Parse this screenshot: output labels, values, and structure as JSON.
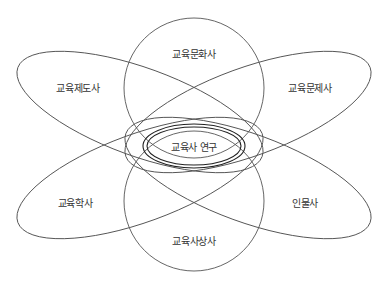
{
  "diagram": {
    "center_label": "교육사 연구",
    "areas": [
      {
        "id": "culture",
        "label": "교육문화사",
        "position": "top"
      },
      {
        "id": "institution",
        "label": "교육제도사",
        "position": "upper-left"
      },
      {
        "id": "problem",
        "label": "교육문제사",
        "position": "upper-right"
      },
      {
        "id": "discipline",
        "label": "교육학사",
        "position": "lower-left"
      },
      {
        "id": "biography",
        "label": "인물사",
        "position": "lower-right"
      },
      {
        "id": "thought",
        "label": "교육사상사",
        "position": "bottom"
      }
    ],
    "colors": {
      "stroke": "#555555",
      "core_stroke": "#222222",
      "text": "#333333",
      "background": "#ffffff"
    }
  }
}
